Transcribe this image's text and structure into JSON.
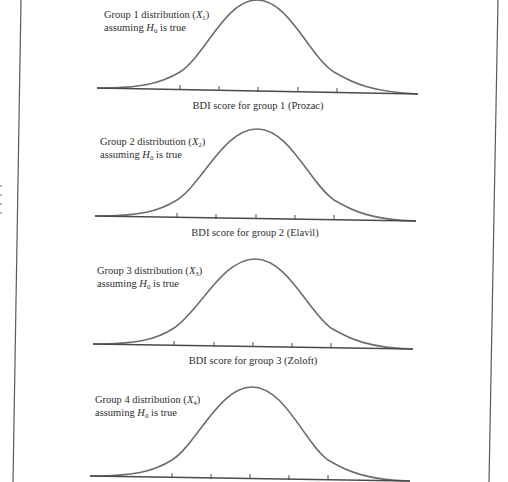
{
  "figure": {
    "panels": [
      {
        "group": 1,
        "annotation_line1_prefix": "Group 1 distribution (",
        "annotation_var": "X",
        "annotation_sub": "1",
        "annotation_line1_suffix": ")",
        "annotation_line2_prefix": "assuming ",
        "annotation_h": "H",
        "annotation_h_sub": "0",
        "annotation_line2_suffix": " is true",
        "xlabel": "BDI score for group 1 (Prozac)"
      },
      {
        "group": 2,
        "annotation_line1_prefix": "Group 2 distribution (",
        "annotation_var": "X",
        "annotation_sub": "2",
        "annotation_line1_suffix": ")",
        "annotation_line2_prefix": "assuming ",
        "annotation_h": "H",
        "annotation_h_sub": "0",
        "annotation_line2_suffix": " is true",
        "xlabel": "BDI score for group 2 (Elavil)"
      },
      {
        "group": 3,
        "annotation_line1_prefix": "Group 3 distribution (",
        "annotation_var": "X",
        "annotation_sub": "3",
        "annotation_line1_suffix": ")",
        "annotation_line2_prefix": "assuming ",
        "annotation_h": "H",
        "annotation_h_sub": "0",
        "annotation_line2_suffix": " is true",
        "xlabel": "BDI score for group 3 (Zoloft)"
      },
      {
        "group": 4,
        "annotation_line1_prefix": "Group 4 distribution (",
        "annotation_var": "X",
        "annotation_sub": "4",
        "annotation_line1_suffix": ")",
        "annotation_line2_prefix": "assuming ",
        "annotation_h": "H",
        "annotation_h_sub": "0",
        "annotation_line2_suffix": " is true",
        "xlabel": ""
      }
    ],
    "ticks_per_axis": 5,
    "colors": {
      "curve": "#6e6e6e",
      "axis": "#4a4a4a",
      "text": "#2e2e2e",
      "background": "#ffffff"
    }
  }
}
